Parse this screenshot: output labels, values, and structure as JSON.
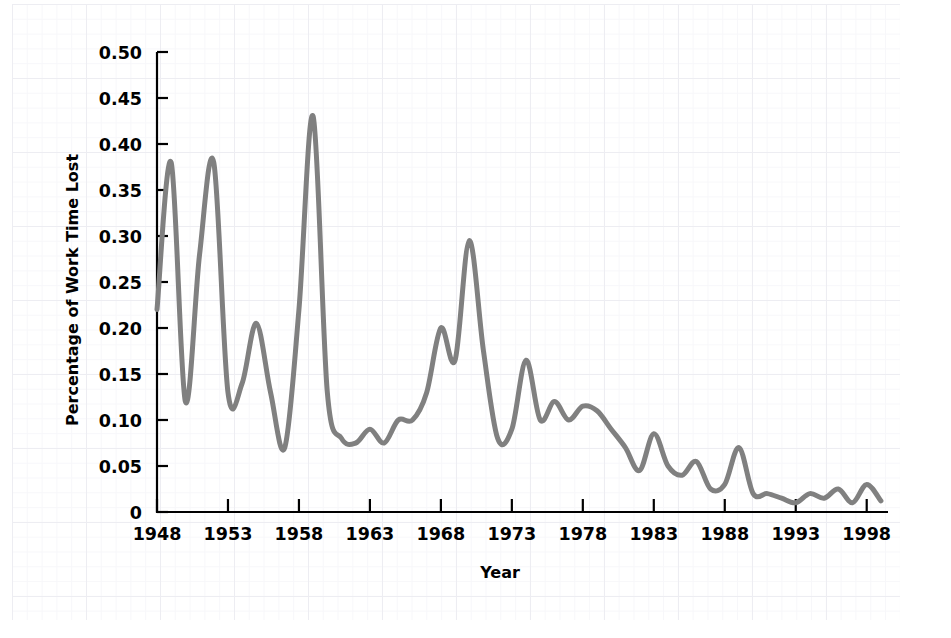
{
  "chart_data": {
    "type": "line",
    "title": "",
    "xlabel": "Year",
    "ylabel": "Percentage of Work Time Lost",
    "xlim": [
      1948,
      1999.5
    ],
    "ylim": [
      0,
      0.5
    ],
    "grid": true,
    "legend": "none",
    "line_color": "#808080",
    "line_width": 5,
    "x_tick_labels": [
      "1948",
      "1953",
      "1958",
      "1963",
      "1968",
      "1973",
      "1978",
      "1983",
      "1988",
      "1993",
      "1998"
    ],
    "x_tick_values": [
      1948,
      1953,
      1958,
      1963,
      1968,
      1973,
      1978,
      1983,
      1988,
      1993,
      1998
    ],
    "y_tick_labels": [
      "0",
      "0.05",
      "0.10",
      "0.15",
      "0.20",
      "0.25",
      "0.30",
      "0.35",
      "0.40",
      "0.45",
      "0.50"
    ],
    "y_tick_values": [
      0,
      0.05,
      0.1,
      0.15,
      0.2,
      0.25,
      0.3,
      0.35,
      0.4,
      0.45,
      0.5
    ],
    "series": [
      {
        "name": "Percentage of Work Time Lost",
        "x": [
          1948,
          1949,
          1950,
          1951,
          1952,
          1953,
          1954,
          1955,
          1956,
          1957,
          1958,
          1959,
          1960,
          1961,
          1962,
          1963,
          1964,
          1965,
          1966,
          1967,
          1968,
          1969,
          1970,
          1971,
          1972,
          1973,
          1974,
          1975,
          1976,
          1977,
          1978,
          1979,
          1980,
          1981,
          1982,
          1983,
          1984,
          1985,
          1986,
          1987,
          1988,
          1989,
          1990,
          1991,
          1992,
          1993,
          1994,
          1995,
          1996,
          1997,
          1998,
          1999
        ],
        "values": [
          0.22,
          0.38,
          0.12,
          0.28,
          0.38,
          0.13,
          0.14,
          0.205,
          0.13,
          0.07,
          0.22,
          0.43,
          0.13,
          0.08,
          0.075,
          0.09,
          0.075,
          0.1,
          0.1,
          0.13,
          0.2,
          0.165,
          0.295,
          0.175,
          0.08,
          0.09,
          0.165,
          0.1,
          0.12,
          0.1,
          0.115,
          0.11,
          0.09,
          0.07,
          0.045,
          0.085,
          0.05,
          0.04,
          0.055,
          0.025,
          0.03,
          0.07,
          0.02,
          0.02,
          0.015,
          0.01,
          0.02,
          0.015,
          0.025,
          0.01,
          0.03,
          0.012
        ]
      }
    ]
  },
  "axes": {
    "y_axis_title": "Percentage of Work Time Lost",
    "x_axis_title": "Year"
  }
}
